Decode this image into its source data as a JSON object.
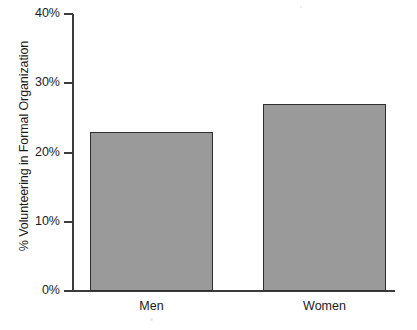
{
  "chart_data": {
    "type": "bar",
    "title": "",
    "xlabel": "",
    "ylabel": "% Volunteering in Formal Organization",
    "categories": [
      "Men",
      "Women"
    ],
    "values": [
      23,
      27
    ],
    "ylim": [
      0,
      40
    ],
    "y_ticks": [
      "0%",
      "10%",
      "20%",
      "30%",
      "40%"
    ],
    "y_tick_values": [
      0,
      10,
      20,
      30,
      40
    ],
    "grid": false,
    "legend": "none",
    "series": [
      {
        "name": "% Volunteering in Formal Organization",
        "values": [
          23,
          27
        ]
      }
    ],
    "colors": {
      "bar_fill": "#9a9a9a",
      "bar_outline": "#2e2e2e",
      "axis": "#3b3b3b",
      "text": "#1a1a1a",
      "background": "#ffffff"
    }
  },
  "axis": {
    "y_title": "% Volunteering in Formal Organization",
    "ticks": [
      {
        "label": "40%",
        "value": 40
      },
      {
        "label": "30%",
        "value": 30
      },
      {
        "label": "20%",
        "value": 20
      },
      {
        "label": "10%",
        "value": 10
      },
      {
        "label": "0%",
        "value": 0
      }
    ]
  },
  "bars": [
    {
      "label": "Men",
      "value": 23
    },
    {
      "label": "Women",
      "value": 27
    }
  ]
}
